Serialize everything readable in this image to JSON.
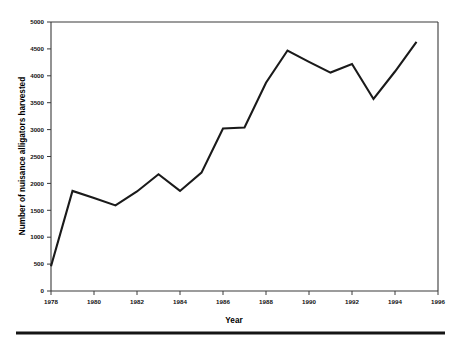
{
  "chart_data": {
    "type": "line",
    "title": "",
    "xlabel": "Year",
    "ylabel": "Number of nuisance alligators harvested",
    "xlim": [
      1978,
      1996
    ],
    "ylim": [
      0,
      5000
    ],
    "grid": false,
    "legend": null,
    "x_tick_labels": [
      "1978",
      "1980",
      "1982",
      "1984",
      "1986",
      "1988",
      "1990",
      "1992",
      "1994",
      "1996"
    ],
    "x_ticks": [
      1978,
      1980,
      1982,
      1984,
      1986,
      1988,
      1990,
      1992,
      1994,
      1996
    ],
    "y_tick_labels": [
      "0",
      "500",
      "1000",
      "1500",
      "2000",
      "2500",
      "3000",
      "3500",
      "4000",
      "4500",
      "5000"
    ],
    "y_ticks": [
      0,
      500,
      1000,
      1500,
      2000,
      2500,
      3000,
      3500,
      4000,
      4500,
      5000
    ],
    "x": [
      1978,
      1979,
      1980,
      1981,
      1982,
      1983,
      1984,
      1985,
      1986,
      1987,
      1988,
      1989,
      1990,
      1991,
      1992,
      1993,
      1994,
      1995
    ],
    "values": [
      460,
      1860,
      1730,
      1590,
      1850,
      2170,
      1860,
      2200,
      3020,
      3040,
      3870,
      4470,
      4260,
      4060,
      4220,
      3570,
      4080,
      4630
    ],
    "series": [
      {
        "name": "Nuisance alligators harvested",
        "color": "#1a1a1a",
        "values": [
          460,
          1860,
          1730,
          1590,
          1850,
          2170,
          1860,
          2200,
          3020,
          3040,
          3870,
          4470,
          4260,
          4060,
          4220,
          3570,
          4080,
          4630
        ]
      }
    ]
  },
  "figure": {
    "axis_color": "#3a3a3a",
    "line_color": "#1a1a1a",
    "rule_color": "#151515"
  }
}
